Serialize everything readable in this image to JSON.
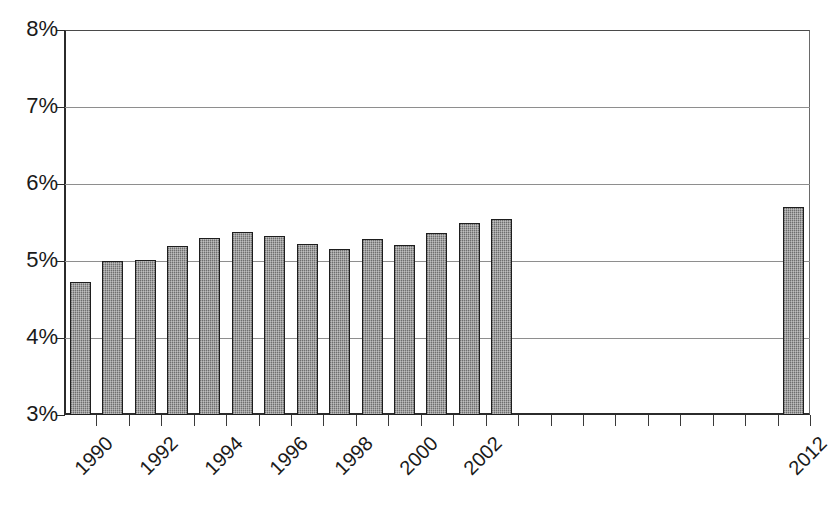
{
  "chart_data": {
    "type": "bar",
    "title": "",
    "subtitle": "",
    "xlabel": "",
    "ylabel": "",
    "ylim": [
      3,
      8
    ],
    "ytick_labels": [
      "8%",
      "7%",
      "6%",
      "5%",
      "4%",
      "3%"
    ],
    "ytick_values": [
      8,
      7,
      6,
      5,
      4,
      3
    ],
    "grid": true,
    "legend": "none",
    "value_unit": "%",
    "categories": [
      "1990",
      "1991",
      "1992",
      "1993",
      "1994",
      "1995",
      "1996",
      "1997",
      "1998",
      "1999",
      "2000",
      "2001",
      "2002",
      "2003",
      "2004",
      "2005",
      "2006",
      "2007",
      "2008",
      "2009",
      "2010",
      "2011",
      "2012"
    ],
    "xtick_labels_shown": [
      "1990",
      "1992",
      "1994",
      "1996",
      "1998",
      "2000",
      "2002",
      "2012"
    ],
    "values": [
      4.73,
      5.0,
      5.01,
      5.2,
      5.3,
      5.38,
      5.32,
      5.22,
      5.15,
      5.29,
      5.21,
      5.37,
      5.49,
      null,
      null,
      null,
      null,
      null,
      null,
      null,
      null,
      null,
      5.7
    ],
    "bars": [
      {
        "year": "1990",
        "value": 4.73
      },
      {
        "year": "1991",
        "value": 5.0
      },
      {
        "year": "1992",
        "value": 5.01
      },
      {
        "year": "1993",
        "value": 5.2
      },
      {
        "year": "1994",
        "value": 5.3
      },
      {
        "year": "1995",
        "value": 5.38
      },
      {
        "year": "1996",
        "value": 5.32
      },
      {
        "year": "1997",
        "value": 5.22
      },
      {
        "year": "1998",
        "value": 5.15
      },
      {
        "year": "1999",
        "value": 5.29
      },
      {
        "year": "2000",
        "value": 5.21
      },
      {
        "year": "2001",
        "value": 5.37
      },
      {
        "year": "2002",
        "value": 5.49
      },
      {
        "year": "2003",
        "value": 5.54
      },
      {
        "year": "2012",
        "value": 5.7
      }
    ],
    "colors": {
      "bar_fill": "#8d8d8d",
      "bar_border": "#1e1e1e",
      "gridline": "#8e8e8e",
      "axis": "#2b2b2b",
      "text": "#1a1a1a",
      "background": "#ffffff"
    }
  }
}
